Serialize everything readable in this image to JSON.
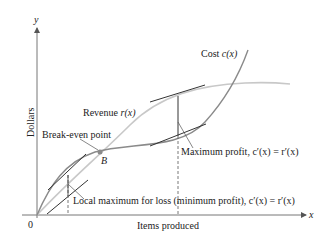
{
  "diagram": {
    "axes": {
      "x_label": "Items produced",
      "y_label": "Dollars",
      "x_var": "x",
      "y_var": "y",
      "origin_label": "0"
    },
    "curves": {
      "cost": {
        "label": "Cost",
        "func": "c(x)",
        "color": "#8a8a8a"
      },
      "revenue": {
        "label": "Revenue",
        "func": "r(x)",
        "color": "#c8c8c8"
      }
    },
    "annotations": {
      "break_even": "Break-even point",
      "point_b": "B",
      "max_profit": "Maximum profit, c′(x) = r′(x)",
      "local_max_loss": "Local maximum for loss (minimum profit), c′(x) = r′(x)"
    },
    "colors": {
      "axis": "#777777",
      "tangent": "#333333",
      "cost": "#8a8a8a",
      "revenue": "#c8c8c8",
      "point": "#8a8a8a"
    }
  }
}
